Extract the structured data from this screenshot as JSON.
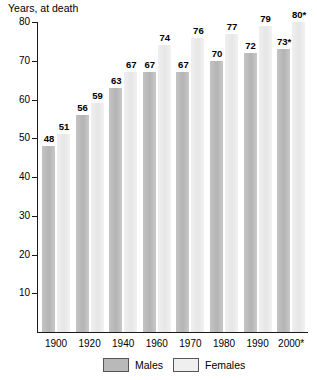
{
  "chart_data": {
    "type": "bar",
    "title": "Years, at death",
    "xlabel": "",
    "ylabel": "Years, at death",
    "ylim": [
      0,
      80
    ],
    "ytick_step": 10,
    "yticks": [
      10,
      20,
      30,
      40,
      50,
      60,
      70,
      80
    ],
    "grid": false,
    "legend_position": "bottom",
    "categories": [
      "1900",
      "1920",
      "1940",
      "1960",
      "1970",
      "1980",
      "1990",
      "2000*"
    ],
    "series": [
      {
        "name": "Males",
        "color": "#b9b9b9",
        "values": [
          48,
          56,
          63,
          67,
          67,
          70,
          72,
          73
        ],
        "labels": [
          "48",
          "56",
          "63",
          "67",
          "67",
          "70",
          "72",
          "73*"
        ]
      },
      {
        "name": "Females",
        "color": "#efefef",
        "values": [
          51,
          59,
          67,
          74,
          76,
          77,
          79,
          80
        ],
        "labels": [
          "51",
          "59",
          "67",
          "74",
          "76",
          "77",
          "79",
          "80*"
        ]
      }
    ]
  },
  "legend": {
    "males_label": "Males",
    "females_label": "Females"
  }
}
